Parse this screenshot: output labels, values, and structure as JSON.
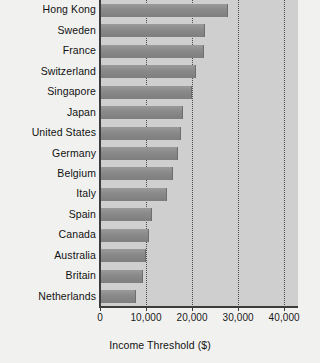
{
  "chart_data": {
    "type": "bar",
    "orientation": "horizontal",
    "title": "",
    "xlabel": "Income Threshold ($)",
    "ylabel": "",
    "xlim": [
      0,
      43000
    ],
    "grid": true,
    "legend": "none",
    "xticks": [
      {
        "value": 0,
        "label": "0"
      },
      {
        "value": 10000,
        "label": "10,000"
      },
      {
        "value": 20000,
        "label": "20,000"
      },
      {
        "value": 30000,
        "label": "30,000"
      },
      {
        "value": 40000,
        "label": "40,000"
      }
    ],
    "categories": [
      "Hong Kong",
      "Sweden",
      "France",
      "Switzerland",
      "Singapore",
      "Japan",
      "United States",
      "Germany",
      "Belgium",
      "Italy",
      "Spain",
      "Canada",
      "Australia",
      "Britain",
      "Netherlands"
    ],
    "values": [
      27800,
      22800,
      22600,
      20800,
      19900,
      18000,
      17500,
      16900,
      15800,
      14500,
      11400,
      10600,
      10000,
      9300,
      7800
    ]
  },
  "colors": {
    "figure_background": "#f1f1f0",
    "plot_background": "#cfcfcf",
    "bar": "#8a8a8a",
    "axis": "#3c3c3c",
    "gridline": "#4a4a4a",
    "text": "#111111"
  }
}
